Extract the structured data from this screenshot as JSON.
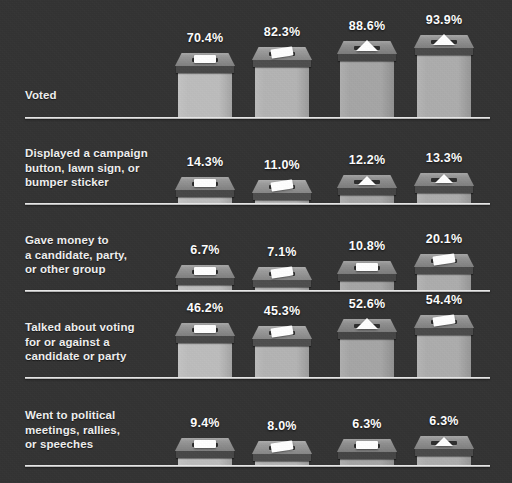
{
  "chart_data": {
    "type": "bar",
    "title": "",
    "xlabel": "",
    "ylabel": "",
    "grid": false,
    "legend": "none",
    "unit": "%",
    "value_suffix": "%",
    "categories": [
      "Voted",
      "Displayed a campaign button, lawn sign, or bumper sticker",
      "Gave money to a candidate, party, or other group",
      "Talked about voting for or against a candidate or party",
      "Went to political meetings, rallies, or speeches"
    ],
    "columns": [
      "col1",
      "col2",
      "col3",
      "col4"
    ],
    "series": [
      {
        "name": "col1",
        "values": [
          70.4,
          14.3,
          6.7,
          46.2,
          9.4
        ]
      },
      {
        "name": "col2",
        "values": [
          82.3,
          11.0,
          7.1,
          45.3,
          8.0
        ]
      },
      {
        "name": "col3",
        "values": [
          88.6,
          12.2,
          10.8,
          52.6,
          6.3
        ]
      },
      {
        "name": "col4",
        "values": [
          93.9,
          13.3,
          20.1,
          54.4,
          6.3
        ]
      }
    ],
    "ylim": [
      0,
      100
    ]
  },
  "colors": {
    "background": "#333333",
    "baseline": "#e9e9e9",
    "label_text": "#f0f0f0",
    "value_text": "#ffffff",
    "box_body": "#b2b2b2",
    "box_lid": "#8d8d8d",
    "box_rim": "#4a4a4a",
    "ballot_paper": "#ffffff",
    "slot": "#2e2e2e"
  },
  "rows": [
    {
      "id": "voted",
      "label_lines": [
        "Voted"
      ],
      "bars": [
        {
          "value_label": "70.4%",
          "value": 70.4,
          "ballot": "flat-slip"
        },
        {
          "value_label": "82.3%",
          "value": 82.3,
          "ballot": "tilted-slip"
        },
        {
          "value_label": "88.6%",
          "value": 88.6,
          "ballot": "triangle"
        },
        {
          "value_label": "93.9%",
          "value": 93.9,
          "ballot": "triangle"
        }
      ]
    },
    {
      "id": "campaign-display",
      "label_lines": [
        "Displayed a campaign",
        "button, lawn sign, or",
        "bumper sticker"
      ],
      "bars": [
        {
          "value_label": "14.3%",
          "value": 14.3,
          "ballot": "flat-slip"
        },
        {
          "value_label": "11.0%",
          "value": 11.0,
          "ballot": "tilted-slip"
        },
        {
          "value_label": "12.2%",
          "value": 12.2,
          "ballot": "triangle"
        },
        {
          "value_label": "13.3%",
          "value": 13.3,
          "ballot": "triangle"
        }
      ]
    },
    {
      "id": "gave-money",
      "label_lines": [
        "Gave money to",
        "a candidate, party,",
        "or other group"
      ],
      "bars": [
        {
          "value_label": "6.7%",
          "value": 6.7,
          "ballot": "flat-slip"
        },
        {
          "value_label": "7.1%",
          "value": 7.1,
          "ballot": "tilted-slip"
        },
        {
          "value_label": "10.8%",
          "value": 10.8,
          "ballot": "flat-slip"
        },
        {
          "value_label": "20.1%",
          "value": 20.1,
          "ballot": "tilted-slip"
        }
      ]
    },
    {
      "id": "talked-about-voting",
      "label_lines": [
        "Talked about voting",
        "for or against a",
        "candidate or party"
      ],
      "bars": [
        {
          "value_label": "46.2%",
          "value": 46.2,
          "ballot": "flat-slip"
        },
        {
          "value_label": "45.3%",
          "value": 45.3,
          "ballot": "tilted-slip"
        },
        {
          "value_label": "52.6%",
          "value": 52.6,
          "ballot": "triangle"
        },
        {
          "value_label": "54.4%",
          "value": 54.4,
          "ballot": "tilted-slip"
        }
      ]
    },
    {
      "id": "political-meetings",
      "label_lines": [
        "Went to political",
        "meetings, rallies,",
        "or speeches"
      ],
      "bars": [
        {
          "value_label": "9.4%",
          "value": 9.4,
          "ballot": "flat-slip"
        },
        {
          "value_label": "8.0%",
          "value": 8.0,
          "ballot": "tilted-slip"
        },
        {
          "value_label": "6.3%",
          "value": 6.3,
          "ballot": "flat-slip"
        },
        {
          "value_label": "6.3%",
          "value": 6.3,
          "ballot": "triangle"
        }
      ]
    }
  ]
}
